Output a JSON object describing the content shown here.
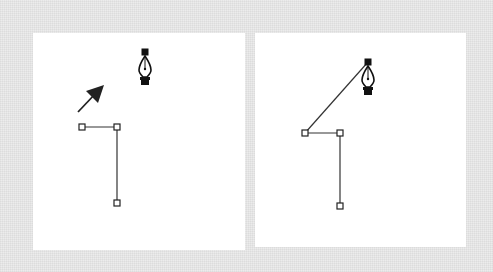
{
  "figure": {
    "colors": {
      "background": "#ececec",
      "panel": "#ffffff",
      "stroke": "#333333",
      "icon": "#111111"
    },
    "panels": [
      {
        "id": "left",
        "anchors": [
          {
            "x": 82,
            "y": 127
          },
          {
            "x": 117,
            "y": 127
          },
          {
            "x": 117,
            "y": 203
          }
        ],
        "pen_cursor": {
          "x": 145,
          "y": 52
        },
        "arrow": {
          "from": {
            "x": 78,
            "y": 112
          },
          "to": {
            "x": 103,
            "y": 86
          }
        }
      },
      {
        "id": "right",
        "anchors": [
          {
            "x": 305,
            "y": 133
          },
          {
            "x": 340,
            "y": 133
          },
          {
            "x": 340,
            "y": 206
          }
        ],
        "pen_cursor": {
          "x": 368,
          "y": 62
        },
        "rubber_band_line": {
          "from": {
            "x": 305,
            "y": 133
          },
          "to": {
            "x": 368,
            "y": 62
          }
        }
      }
    ]
  }
}
